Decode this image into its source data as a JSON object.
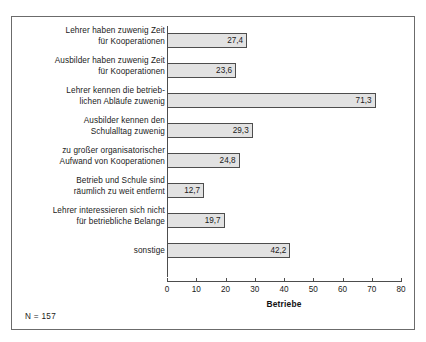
{
  "figure": {
    "note": "N = 157",
    "axis_title": "Betriebe"
  },
  "chart_data": {
    "type": "bar",
    "orientation": "horizontal",
    "title": "",
    "subtitle": "",
    "xlabel": "Betriebe",
    "ylabel": "",
    "xlim": [
      0,
      80
    ],
    "xticks": [
      0,
      10,
      20,
      30,
      40,
      50,
      60,
      70,
      80
    ],
    "xtick_labels": [
      "0",
      "10",
      "20",
      "30",
      "40",
      "50",
      "60",
      "70",
      "80"
    ],
    "grid": false,
    "legend": false,
    "bar_fill_color": "#e2e2e2",
    "bar_edge_color": "#4d4d4d",
    "categories": [
      "Lehrer haben zuwenig Zeit\nfür Kooperationen",
      "Ausbilder haben zuwenig Zeit\nfür Kooperationen",
      "Lehrer kennen die betrieb-\nlichen Abläufe zuwenig",
      "Ausbilder kennen den\nSchulalltag zuwenig",
      "zu großer organisatorischer\nAufwand von Kooperationen",
      "Betrieb und Schule sind\nräumlich zu weit entfernt",
      "Lehrer interessieren sich nicht\nfür betriebliche Belange",
      "sonstige"
    ],
    "values": [
      27.4,
      23.6,
      71.3,
      29.3,
      24.8,
      12.7,
      19.7,
      42.2
    ],
    "value_labels": [
      "27,4",
      "23,6",
      "71,3",
      "29,3",
      "24,8",
      "12,7",
      "19,7",
      "42,2"
    ],
    "annotations": [
      "N = 157"
    ]
  }
}
